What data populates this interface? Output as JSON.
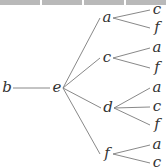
{
  "diagram": {
    "type": "tree",
    "orientation": "left-to-right",
    "colors": {
      "edge": "#7a7a7a",
      "label": "#333333",
      "top_strip": "#b9b9b9"
    },
    "nodes": [
      {
        "id": "n_b",
        "label": "b",
        "x": 7,
        "y": 88
      },
      {
        "id": "n_e",
        "label": "e",
        "x": 57,
        "y": 88
      },
      {
        "id": "n_a",
        "label": "a",
        "x": 107,
        "y": 18
      },
      {
        "id": "n_c",
        "label": "c",
        "x": 107,
        "y": 58
      },
      {
        "id": "n_d",
        "label": "d",
        "x": 108,
        "y": 108
      },
      {
        "id": "n_f",
        "label": "f",
        "x": 107,
        "y": 154
      },
      {
        "id": "l_a_c",
        "label": "c",
        "x": 157,
        "y": 10
      },
      {
        "id": "l_a_f",
        "label": "f",
        "x": 157,
        "y": 28
      },
      {
        "id": "l_c_a",
        "label": "a",
        "x": 157,
        "y": 48
      },
      {
        "id": "l_c_f",
        "label": "f",
        "x": 157,
        "y": 68
      },
      {
        "id": "l_d_a",
        "label": "a",
        "x": 157,
        "y": 88
      },
      {
        "id": "l_d_c",
        "label": "c",
        "x": 157,
        "y": 107
      },
      {
        "id": "l_d_f",
        "label": "f",
        "x": 157,
        "y": 125
      },
      {
        "id": "l_f_a",
        "label": "a",
        "x": 157,
        "y": 145
      },
      {
        "id": "l_f_c",
        "label": "c",
        "x": 157,
        "y": 163
      }
    ],
    "edges": [
      [
        "n_b",
        "n_e"
      ],
      [
        "n_e",
        "n_a"
      ],
      [
        "n_e",
        "n_c"
      ],
      [
        "n_e",
        "n_d"
      ],
      [
        "n_e",
        "n_f"
      ],
      [
        "n_a",
        "l_a_c"
      ],
      [
        "n_a",
        "l_a_f"
      ],
      [
        "n_c",
        "l_c_a"
      ],
      [
        "n_c",
        "l_c_f"
      ],
      [
        "n_d",
        "l_d_a"
      ],
      [
        "n_d",
        "l_d_c"
      ],
      [
        "n_d",
        "l_d_f"
      ],
      [
        "n_f",
        "l_f_a"
      ],
      [
        "n_f",
        "l_f_c"
      ]
    ]
  }
}
